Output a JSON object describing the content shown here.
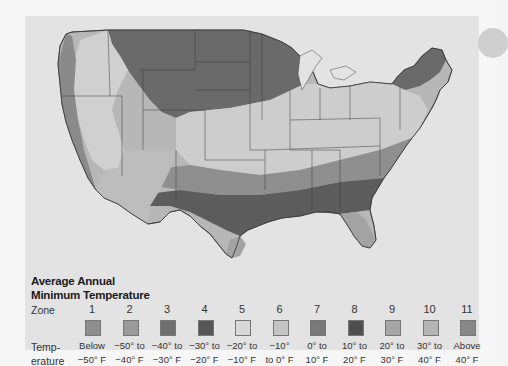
{
  "legend": {
    "title_line1": "Average Annual",
    "title_line2": "Minimum Temperature",
    "zone_label": "Zone",
    "temp_label_line1": "Temp-",
    "temp_label_line2": "erature",
    "zones": [
      {
        "zone": "1",
        "range_line1": "Below",
        "range_line2": "−50° F",
        "color": "#8e8e8e"
      },
      {
        "zone": "2",
        "range_line1": "−50° to",
        "range_line2": "−40° F",
        "color": "#9a9a9a"
      },
      {
        "zone": "3",
        "range_line1": "−40° to",
        "range_line2": "−30° F",
        "color": "#6e6e6e"
      },
      {
        "zone": "4",
        "range_line1": "−30° to",
        "range_line2": "−20° F",
        "color": "#555555"
      },
      {
        "zone": "5",
        "range_line1": "−20° to",
        "range_line2": "−10° F",
        "color": "#d8d8d8"
      },
      {
        "zone": "6",
        "range_line1": "−10°",
        "range_line2": "to 0° F",
        "color": "#c4c4c4"
      },
      {
        "zone": "7",
        "range_line1": "0° to",
        "range_line2": "10° F",
        "color": "#7a7a7a"
      },
      {
        "zone": "8",
        "range_line1": "10° to",
        "range_line2": "20° F",
        "color": "#4e4e4e"
      },
      {
        "zone": "9",
        "range_line1": "20° to",
        "range_line2": "30° F",
        "color": "#a6a6a6"
      },
      {
        "zone": "10",
        "range_line1": "30° to",
        "range_line2": "40° F",
        "color": "#b4b4b4"
      },
      {
        "zone": "11",
        "range_line1": "Above",
        "range_line2": "40° F",
        "color": "#888888"
      }
    ]
  },
  "map": {
    "subject": "Contiguous United States plant hardiness zones",
    "background_color": "#e3e3e3"
  }
}
